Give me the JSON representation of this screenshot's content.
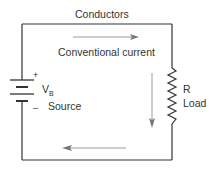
{
  "diagram": {
    "type": "circuit",
    "labels": {
      "conductors": "Conductors",
      "conventional_current": "Conventional current",
      "plus": "+",
      "minus": "–",
      "vb_main": "V",
      "vb_sub": "B",
      "source": "Source",
      "resistor": "R",
      "load": "Load"
    },
    "components": [
      {
        "id": "battery",
        "symbol": "battery-icon",
        "label": "V_B Source"
      },
      {
        "id": "resistor",
        "symbol": "resistor-icon",
        "label": "R Load"
      },
      {
        "id": "wires",
        "symbol": "conductor-wire",
        "label": "Conductors"
      }
    ],
    "arrows": [
      {
        "id": "top-arrow",
        "direction": "right"
      },
      {
        "id": "right-arrow",
        "direction": "down"
      },
      {
        "id": "bottom-arrow",
        "direction": "left"
      }
    ],
    "colors": {
      "wire": "#333333",
      "arrow": "#9a9a9a",
      "text": "#333333"
    }
  }
}
